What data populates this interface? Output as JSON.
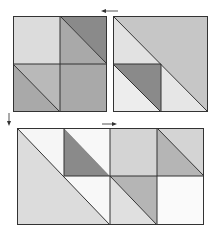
{
  "diagram": {
    "caption": "",
    "colors": {
      "outline": "#333333",
      "very_light": "#ececec",
      "light": "#dcdcdc",
      "medium_light": "#c6c6c6",
      "medium": "#a9a9a9",
      "dark": "#8a8a8a",
      "white": "#fafafa"
    },
    "arrows": [
      {
        "name": "arrow-left",
        "direction": "left"
      },
      {
        "name": "arrow-down",
        "direction": "down"
      },
      {
        "name": "arrow-right",
        "direction": "right"
      }
    ],
    "panels": [
      {
        "name": "block-a",
        "description": "2x2 quilt block with half-square triangles"
      },
      {
        "name": "block-b",
        "description": "large half-square triangle block with inner small triangle unit"
      },
      {
        "name": "block-c",
        "description": "4x2 combined quilt layout"
      }
    ]
  }
}
